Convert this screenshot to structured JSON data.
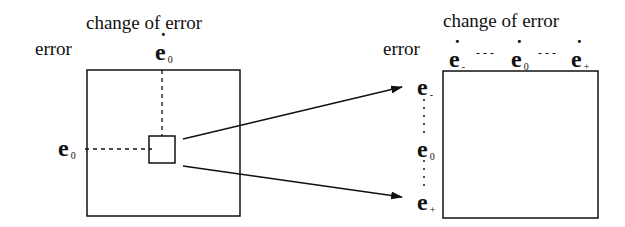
{
  "left_grid": {
    "column_label": "change of error",
    "row_label": "error",
    "col_marker": {
      "symbol": "e",
      "subscript": "0",
      "dot": "˙"
    },
    "row_marker": {
      "symbol": "e",
      "subscript": "0"
    }
  },
  "right_grid": {
    "column_label": "change of error",
    "row_label": "error",
    "col_markers": [
      {
        "symbol": "e",
        "subscript": "-",
        "dot": "˙"
      },
      {
        "symbol": "e",
        "subscript": "0",
        "dot": "˙"
      },
      {
        "symbol": "e",
        "subscript": "+",
        "dot": "˙"
      }
    ],
    "col_separator": "- - -",
    "row_markers": [
      {
        "symbol": "e",
        "subscript": "-"
      },
      {
        "symbol": "e",
        "subscript": "0"
      },
      {
        "symbol": "e",
        "subscript": "+"
      }
    ]
  },
  "colors": {
    "stroke": "#111111",
    "background": "#ffffff"
  }
}
